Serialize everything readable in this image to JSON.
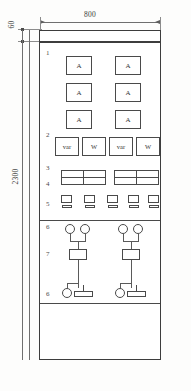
{
  "drawing": {
    "title": "Switchgear Panel Front Elevation",
    "dimensions": {
      "width_label": "800",
      "height_label": "2300",
      "top_band_label": "60"
    },
    "callouts": {
      "item1": "1",
      "item2": "2",
      "item3": "3",
      "item4": "4",
      "item5": "5",
      "item6a": "6",
      "item7": "7",
      "item6b": "6"
    },
    "ammeters": [
      {
        "label": "A"
      },
      {
        "label": "A"
      },
      {
        "label": "A"
      },
      {
        "label": "A"
      },
      {
        "label": "A"
      },
      {
        "label": "A"
      }
    ],
    "power_meters": [
      {
        "label": "var"
      },
      {
        "label": "W"
      },
      {
        "label": "var"
      },
      {
        "label": "W"
      }
    ],
    "relay_blocks": [
      {
        "cells": 4
      },
      {
        "cells": 4
      }
    ],
    "pushbuttons": [
      {
        "index": 1
      },
      {
        "index": 2
      },
      {
        "index": 3
      },
      {
        "index": 4
      },
      {
        "index": 5
      }
    ],
    "control_lamps": [
      {
        "group": 1,
        "position": "left"
      },
      {
        "group": 1,
        "position": "right"
      },
      {
        "group": 2,
        "position": "left"
      },
      {
        "group": 2,
        "position": "right"
      }
    ],
    "control_boxes": [
      {
        "group": 1
      },
      {
        "group": 2
      }
    ],
    "control_switches": [
      {
        "group": 1
      },
      {
        "group": 2
      }
    ],
    "colors": {
      "line": "#4a4a4a",
      "outline": "#3d3d3d",
      "dimension": "#6f6f6f",
      "text": "#333333",
      "background": "#ffffff"
    }
  }
}
